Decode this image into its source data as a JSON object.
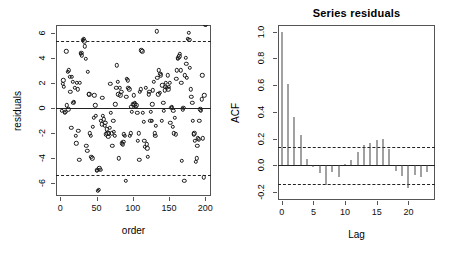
{
  "figure": {
    "kind": "r-diagnostic-two-panel",
    "background": "#ffffff",
    "point_color": "#1a1a1a",
    "line_color": "#222222",
    "axis_color": "#555555"
  },
  "left_panel": {
    "name": "residuals-vs-order-scatter",
    "title": "",
    "xlabel": "order",
    "ylabel": "residuals",
    "x_ticks": [
      "0",
      "50",
      "100",
      "150",
      "200"
    ],
    "y_ticks": [
      "-6",
      "-4",
      "-2",
      "0",
      "2",
      "4",
      "6"
    ]
  },
  "right_panel": {
    "name": "acf-correlogram",
    "title": "Series  residuals",
    "xlabel": "Lag",
    "ylabel": "ACF",
    "x_ticks": [
      "0",
      "5",
      "10",
      "15",
      "20"
    ],
    "y_ticks": [
      "-0.2",
      "0.0",
      "0.2",
      "0.4",
      "0.6",
      "0.8",
      "1.0"
    ]
  },
  "chart_data": [
    {
      "type": "scatter",
      "title": "",
      "xlabel": "order",
      "ylabel": "residuals",
      "xlim": [
        -6,
        208
      ],
      "ylim": [
        -7.0,
        6.6
      ],
      "xticks": [
        0,
        50,
        100,
        150,
        200
      ],
      "yticks": [
        -6,
        -4,
        -2,
        0,
        2,
        4,
        6
      ],
      "grid": false,
      "legend": null,
      "reference_lines": [
        {
          "type": "solid",
          "y": 0,
          "label": "zero-line"
        },
        {
          "type": "dashed",
          "y": 5.35,
          "label": "upper-limit"
        },
        {
          "type": "dashed",
          "y": -5.35,
          "label": "lower-limit"
        }
      ],
      "x": [
        2,
        3,
        4,
        5,
        6,
        7,
        8,
        9,
        10,
        11,
        12,
        13,
        14,
        15,
        16,
        17,
        18,
        19,
        20,
        21,
        22,
        23,
        24,
        25,
        26,
        27,
        28,
        29,
        30,
        31,
        32,
        33,
        34,
        35,
        36,
        37,
        38,
        39,
        40,
        41,
        42,
        43,
        44,
        45,
        46,
        47,
        48,
        49,
        50,
        51,
        52,
        53,
        54,
        55,
        56,
        57,
        58,
        59,
        60,
        61,
        62,
        63,
        64,
        65,
        66,
        67,
        68,
        69,
        70,
        71,
        72,
        73,
        74,
        75,
        76,
        77,
        78,
        79,
        80,
        81,
        82,
        83,
        84,
        85,
        86,
        87,
        88,
        89,
        90,
        91,
        92,
        93,
        94,
        95,
        96,
        97,
        98,
        99,
        100,
        101,
        102,
        103,
        104,
        105,
        106,
        107,
        108,
        109,
        110,
        111,
        112,
        113,
        114,
        115,
        116,
        117,
        118,
        119,
        120,
        121,
        122,
        123,
        124,
        125,
        126,
        127,
        128,
        129,
        130,
        131,
        132,
        133,
        134,
        135,
        136,
        137,
        138,
        139,
        140,
        141,
        142,
        143,
        144,
        145,
        146,
        147,
        148,
        149,
        150,
        151,
        152,
        153,
        154,
        155,
        156,
        157,
        158,
        159,
        160,
        161,
        162,
        163,
        164,
        165,
        166,
        167,
        168,
        169,
        170,
        171,
        172,
        173,
        174,
        175,
        176,
        177,
        178,
        179,
        180,
        181,
        182,
        183,
        184,
        185,
        186,
        187,
        188,
        189,
        190,
        191,
        192,
        193,
        194,
        195,
        196,
        197,
        198,
        199,
        200,
        201
      ],
      "y": [
        -0.2,
        1.9,
        2.2,
        1.7,
        -0.4,
        -0.3,
        4.5,
        0.2,
        2.9,
        -0.1,
        3.0,
        2.5,
        1.3,
        -1.6,
        2.5,
        2.1,
        0.4,
        0.5,
        1.6,
        -2.2,
        -2.8,
        2.0,
        1.5,
        -1.8,
        -4.1,
        2.0,
        4.3,
        4.4,
        4.2,
        5.4,
        5.5,
        5.3,
        4.9,
        3.9,
        -3.0,
        -3.4,
        2.9,
        1.1,
        1.1,
        -2.0,
        -2.2,
        -3.9,
        -4.0,
        -1.5,
        -0.8,
        1.0,
        0.2,
        -0.6,
        -5.0,
        -4.9,
        -6.6,
        -6.5,
        -4.8,
        -4.9,
        -1.0,
        -1.3,
        0.8,
        -0.6,
        -0.9,
        -1.4,
        -1.2,
        -2.1,
        -1.7,
        -2.0,
        -2.3,
        -2.0,
        -1.6,
        1.9,
        -0.4,
        -2.0,
        -3.0,
        -1.0,
        -1.9,
        -2.2,
        0.3,
        1.6,
        3.4,
        2.1,
        1.1,
        -4.0,
        1.6,
        1.0,
        1.3,
        -2.8,
        -2.9,
        -2.7,
        -2.1,
        -2.2,
        -5.8,
        0.9,
        2.3,
        2.2,
        1.6,
        1.5,
        -2.2,
        -2.0,
        0.1,
        -0.3,
        0.3,
        1.0,
        0.3,
        0.4,
        0.1,
        0.2,
        -0.4,
        -2.6,
        -2.0,
        -4.1,
        1.3,
        1.5,
        4.6,
        4.5,
        -0.4,
        -1.1,
        -2.6,
        -3.1,
        1.6,
        -2.9,
        -3.2,
        -3.9,
        1.1,
        1.3,
        -1.0,
        -0.3,
        -1.0,
        0.3,
        1.4,
        2.1,
        -2.0,
        -2.2,
        -1.4,
        6.1,
        2.4,
        1.1,
        3.0,
        1.2,
        2.7,
        2.6,
        -1.0,
        1.8,
        0.4,
        -0.2,
        1.4,
        1.7,
        2.0,
        1.6,
        2.6,
        1.5,
        1.7,
        2.0,
        -1.2,
        0.0,
        0.1,
        -1.5,
        -0.2,
        -2.0,
        -0.8,
        -2.1,
        2.3,
        3.0,
        3.9,
        4.0,
        4.1,
        4.3,
        3.0,
        2.0,
        -4.2,
        -0.1,
        0.0,
        -5.8,
        2.6,
        4.0,
        3.5,
        2.4,
        5.5,
        6.0,
        5.4,
        3.2,
        1.5,
        0.9,
        0.4,
        -1.0,
        -2.1,
        -2.0,
        -2.6,
        -4.3,
        -4.0,
        -3.0,
        -2.4,
        -2.5,
        -1.0,
        -0.1,
        -0.2,
        0.7,
        2.6,
        -2.4,
        -5.5,
        1.0
      ]
    },
    {
      "type": "bar",
      "subtype": "acf-correlogram",
      "title": "Series  residuals",
      "xlabel": "Lag",
      "ylabel": "ACF",
      "xlim": [
        -0.6,
        24.2
      ],
      "ylim": [
        -0.26,
        1.05
      ],
      "xticks": [
        0,
        5,
        10,
        15,
        20
      ],
      "yticks": [
        -0.2,
        0.0,
        0.2,
        0.4,
        0.6,
        0.8,
        1.0
      ],
      "grid": false,
      "legend": null,
      "confidence_bounds": {
        "upper": 0.139,
        "lower": -0.139,
        "style": "dashed"
      },
      "categories": [
        0,
        1,
        2,
        3,
        4,
        5,
        6,
        7,
        8,
        9,
        10,
        11,
        12,
        13,
        14,
        15,
        16,
        17,
        18,
        19,
        20,
        21,
        22,
        23
      ],
      "values": [
        1.0,
        0.61,
        0.36,
        0.23,
        0.05,
        -0.01,
        -0.06,
        -0.15,
        -0.05,
        -0.09,
        0.01,
        0.04,
        0.1,
        0.15,
        0.17,
        0.19,
        0.2,
        0.12,
        -0.04,
        -0.08,
        -0.17,
        -0.07,
        -0.09,
        -0.05
      ]
    }
  ]
}
